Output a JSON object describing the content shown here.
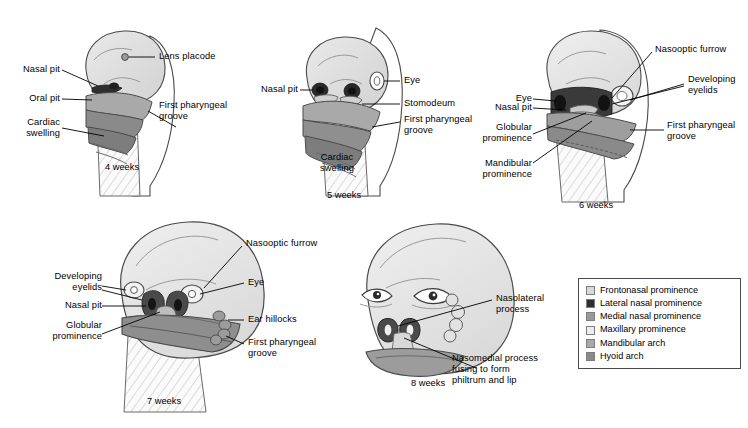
{
  "figure": {
    "background": "#ffffff"
  },
  "panels": [
    {
      "id": "four-weeks",
      "week_label": "4 weeks",
      "labels": [
        {
          "key": "lens_placode",
          "text": "Lens placode"
        },
        {
          "key": "nasal_pit",
          "text": "Nasal pit"
        },
        {
          "key": "oral_pit",
          "text": "Oral pit"
        },
        {
          "key": "cardiac_swelling",
          "text": "Cardiac\nswelling"
        },
        {
          "key": "first_pharyngeal_groove",
          "text": "First pharyngeal\ngroove"
        }
      ]
    },
    {
      "id": "five-weeks",
      "week_label": "5 weeks",
      "labels": [
        {
          "key": "nasal_pit",
          "text": "Nasal pit"
        },
        {
          "key": "eye",
          "text": "Eye"
        },
        {
          "key": "stomodeum",
          "text": "Stomodeum"
        },
        {
          "key": "first_pharyngeal_groove",
          "text": "First pharyngeal\ngroove"
        },
        {
          "key": "cardiac_swelling",
          "text": "Cardiac\nswelling"
        }
      ]
    },
    {
      "id": "six-weeks",
      "week_label": "6 weeks",
      "labels": [
        {
          "key": "nasooptic_furrow",
          "text": "Nasooptic furrow"
        },
        {
          "key": "developing_eyelids",
          "text": "Developing\neyelids"
        },
        {
          "key": "eye",
          "text": "Eye"
        },
        {
          "key": "nasal_pit",
          "text": "Nasal pit"
        },
        {
          "key": "globular_prominence",
          "text": "Globular\nprominence"
        },
        {
          "key": "mandibular_prominence",
          "text": "Mandibular\nprominence"
        },
        {
          "key": "first_pharyngeal_groove",
          "text": "First pharyngeal\ngroove"
        }
      ]
    },
    {
      "id": "seven-weeks",
      "week_label": "7 weeks",
      "labels": [
        {
          "key": "nasooptic_furrow",
          "text": "Nasooptic furrow"
        },
        {
          "key": "developing_eyelids",
          "text": "Developing\neyelids"
        },
        {
          "key": "nasal_pit",
          "text": "Nasal pit"
        },
        {
          "key": "globular_prominence",
          "text": "Globular\nprominence"
        },
        {
          "key": "eye",
          "text": "Eye"
        },
        {
          "key": "ear_hillocks",
          "text": "Ear hillocks"
        },
        {
          "key": "first_pharyngeal_groove",
          "text": "First pharyngeal\ngroove"
        }
      ]
    },
    {
      "id": "eight-weeks",
      "week_label": "8 weeks",
      "labels": [
        {
          "key": "nasolateral_process",
          "text": "Nasolateral\nprocess"
        },
        {
          "key": "nasomedial_process",
          "text": "Nasomedial process\nfusing to form\nphiltrum and lip"
        }
      ]
    }
  ],
  "legend": {
    "items": [
      {
        "label": "Frontonasal prominence",
        "color": "#d8d8d8"
      },
      {
        "label": "Lateral nasal prominence",
        "color": "#2e2e2e"
      },
      {
        "label": "Medial nasal prominence",
        "color": "#9a9a9a"
      },
      {
        "label": "Maxillary prominence",
        "color": "#ececec"
      },
      {
        "label": "Mandibular arch",
        "color": "#a9a9a9"
      },
      {
        "label": "Hyoid arch",
        "color": "#8a8a8a"
      }
    ]
  }
}
